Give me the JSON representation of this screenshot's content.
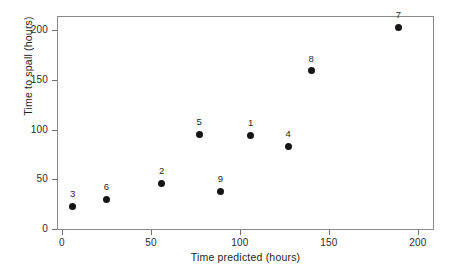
{
  "chart_data": {
    "type": "scatter",
    "title": "",
    "xlabel": "Time predicted (hours)",
    "ylabel": "Time to spall (hours)",
    "xlim": [
      -4,
      208
    ],
    "ylim": [
      -4,
      215
    ],
    "xticks": [
      0,
      50,
      100,
      150,
      200
    ],
    "yticks": [
      0,
      50,
      100,
      150,
      200
    ],
    "xtick_labels": [
      "0",
      "50",
      "100",
      "150",
      "200"
    ],
    "ytick_labels": [
      "0",
      "50",
      "100",
      "150",
      "200"
    ],
    "grid": false,
    "legend": false,
    "point_label_position": "above",
    "marker": "filled-circle",
    "marker_color": "#151515",
    "frame_color": "#8a8a8a",
    "points": [
      {
        "label": "3",
        "x": 6,
        "y": 23
      },
      {
        "label": "6",
        "x": 25,
        "y": 30
      },
      {
        "label": "2",
        "x": 56,
        "y": 46
      },
      {
        "label": "5",
        "x": 77,
        "y": 95
      },
      {
        "label": "9",
        "x": 89,
        "y": 38
      },
      {
        "label": "1",
        "x": 106,
        "y": 94
      },
      {
        "label": "4",
        "x": 127,
        "y": 83
      },
      {
        "label": "8",
        "x": 140,
        "y": 159
      },
      {
        "label": "7",
        "x": 189,
        "y": 203
      }
    ]
  }
}
